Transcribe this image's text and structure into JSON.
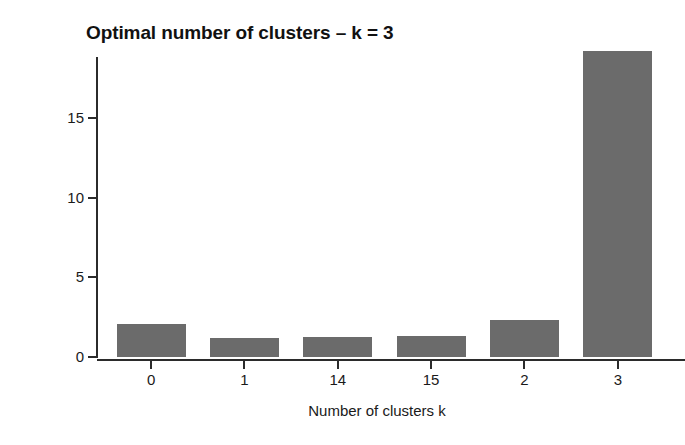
{
  "chart_data": {
    "type": "bar",
    "title": "Optimal number of clusters – k = 3",
    "xlabel": "Number of clusters k",
    "ylabel": "Frequency among all indices",
    "categories": [
      "0",
      "1",
      "14",
      "15",
      "2",
      "3"
    ],
    "values": [
      2.1,
      1.2,
      1.25,
      1.3,
      2.3,
      19.2
    ],
    "series": [
      {
        "name": "Frequency among all indices",
        "values": [
          2.1,
          1.2,
          1.25,
          1.3,
          2.3,
          19.2
        ]
      }
    ],
    "ylim": [
      0,
      19.2
    ],
    "yticks": [
      0,
      5,
      10,
      15
    ],
    "ytick_labels": [
      "0",
      "5",
      "10",
      "15"
    ],
    "xtick_labels": [
      "0",
      "1",
      "14",
      "15",
      "2",
      "3"
    ],
    "grid": false,
    "legend": false,
    "bar_color": "#6b6b6b",
    "axis_color": "#2b2b2b",
    "background": "#ffffff"
  },
  "figure": {
    "title": "Optimal number of clusters – k = 3",
    "x_axis_title": "Number of clusters k",
    "y_axis_title": "Frequency among all indices"
  }
}
